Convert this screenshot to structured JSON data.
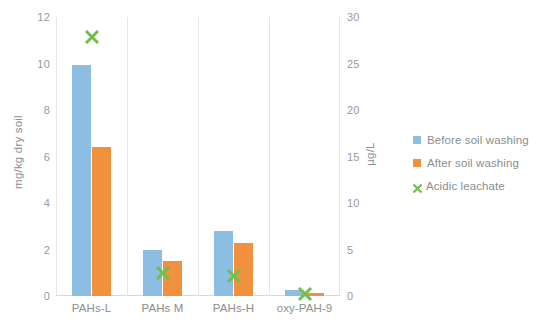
{
  "chart_data": {
    "type": "bar",
    "title": "",
    "xlabel": "",
    "ylabel": "mg/kg dry soil",
    "y2label": "µg/L",
    "categories": [
      "PAHs-L",
      "PAHs M",
      "PAHs-H",
      "oxy-PAH-9"
    ],
    "ylim": [
      0,
      12
    ],
    "y2lim": [
      0,
      30
    ],
    "yticks": [
      "12",
      "10",
      "8",
      "6",
      "4",
      "2",
      "0"
    ],
    "ytick_values": [
      12,
      10,
      8,
      6,
      4,
      2,
      0
    ],
    "y2ticks": [
      "30",
      "25",
      "20",
      "15",
      "10",
      "5",
      "0"
    ],
    "y2tick_values": [
      30,
      25,
      20,
      15,
      10,
      5,
      0
    ],
    "grid": "vertical-category-separators",
    "legend_position": "right",
    "series": [
      {
        "name": "Before soil washing",
        "type": "bar",
        "axis": "left",
        "color": "#8cbde3",
        "values": [
          9.95,
          2.0,
          2.8,
          0.25
        ]
      },
      {
        "name": "After soil washing",
        "type": "bar",
        "axis": "left",
        "color": "#f2913d",
        "values": [
          6.4,
          1.5,
          2.3,
          0.12
        ]
      },
      {
        "name": "Acidic leachate",
        "type": "scatter",
        "marker": "x",
        "axis": "right",
        "color": "#6ec04b",
        "values": [
          27.9,
          2.5,
          2.2,
          0.2
        ]
      }
    ]
  },
  "axes": {
    "left": {
      "title": "mg/kg dry soil",
      "ticks": [
        "12",
        "10",
        "8",
        "6",
        "4",
        "2",
        "0"
      ]
    },
    "right": {
      "title": "µg/L",
      "ticks": [
        "30",
        "25",
        "20",
        "15",
        "10",
        "5",
        "0"
      ]
    },
    "categories": [
      "PAHs-L",
      "PAHs M",
      "PAHs-H",
      "oxy-PAH-9"
    ]
  },
  "legend": {
    "items": [
      {
        "label": "Before soil washing",
        "marker": "square",
        "color": "#8cbde3"
      },
      {
        "label": "After soil washing",
        "marker": "square",
        "color": "#f2913d"
      },
      {
        "label": "Acidic leachate",
        "marker": "x",
        "color": "#6ec04b"
      }
    ]
  }
}
